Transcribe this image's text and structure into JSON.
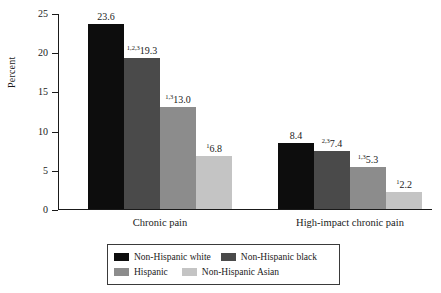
{
  "chart_data": {
    "type": "bar",
    "title": "",
    "xlabel": "",
    "ylabel": "Percent",
    "ylim": [
      0,
      25
    ],
    "yticks": [
      "0",
      "5",
      "10",
      "15",
      "20",
      "25"
    ],
    "grid": false,
    "legend_position": "bottom",
    "categories": [
      "Chronic pain",
      "High-impact chronic pain"
    ],
    "series": [
      {
        "name": "Non-Hispanic white",
        "color": "#0d0d0d",
        "values": [
          23.6,
          8.4
        ],
        "labels": [
          "23.6",
          "8.4"
        ],
        "superscripts": [
          "",
          ""
        ]
      },
      {
        "name": "Non-Hispanic black",
        "color": "#4a4a4a",
        "values": [
          19.3,
          7.4
        ],
        "labels": [
          "19.3",
          "7.4"
        ],
        "superscripts": [
          "1,2,3",
          "2,3"
        ]
      },
      {
        "name": "Hispanic",
        "color": "#8c8c8c",
        "values": [
          13.0,
          5.3
        ],
        "labels": [
          "13.0",
          "5.3"
        ],
        "superscripts": [
          "1,3",
          "1,3"
        ]
      },
      {
        "name": "Non-Hispanic Asian",
        "color": "#c4c4c4",
        "values": [
          6.8,
          2.2
        ],
        "labels": [
          "6.8",
          "2.2"
        ],
        "superscripts": [
          "1",
          "1"
        ]
      }
    ]
  },
  "axis": {
    "y_title": "Percent",
    "ticks": [
      {
        "value": 25,
        "label": "25"
      },
      {
        "value": 20,
        "label": "20"
      },
      {
        "value": 15,
        "label": "15"
      },
      {
        "value": 10,
        "label": "10"
      },
      {
        "value": 5,
        "label": "5"
      },
      {
        "value": 0,
        "label": "0"
      }
    ]
  },
  "groups": [
    {
      "label": "Chronic pain"
    },
    {
      "label": "High-impact chronic pain"
    }
  ],
  "legend": {
    "rows": [
      [
        {
          "label": "Non-Hispanic white",
          "color": "#0d0d0d"
        },
        {
          "label": "Non-Hispanic black",
          "color": "#4a4a4a"
        }
      ],
      [
        {
          "label": "Hispanic",
          "color": "#8c8c8c"
        },
        {
          "label": "Non-Hispanic Asian",
          "color": "#c4c4c4"
        }
      ]
    ]
  }
}
